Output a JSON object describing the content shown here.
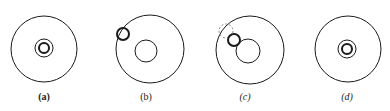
{
  "panels": [
    {
      "id": "a",
      "label": "(a)",
      "outer": {
        "cx": 44,
        "cy": 49,
        "r": 33
      },
      "inner_ring": {
        "cx": 44,
        "cy": 48,
        "r": 9
      },
      "inner_dot": {
        "cx": 44,
        "cy": 48,
        "r": 5
      },
      "label_x": 44
    },
    {
      "id": "b",
      "label": "(b)",
      "outer": {
        "cx": 150,
        "cy": 49,
        "r": 34
      },
      "big_circle": {
        "cx": 146,
        "cy": 51,
        "r": 11
      },
      "small_thick": {
        "cx": 123,
        "cy": 34,
        "r": 6
      },
      "label_x": 146
    },
    {
      "id": "c",
      "label": "(c)",
      "outer": {
        "cx": 250,
        "cy": 50,
        "r": 34
      },
      "big_circle": {
        "cx": 248,
        "cy": 50,
        "r": 12
      },
      "small_thick": {
        "cx": 234,
        "cy": 40,
        "r": 6
      },
      "dashed": {
        "cx": 226,
        "cy": 31,
        "r": 7
      },
      "label_x": 245
    },
    {
      "id": "d",
      "label": "(d)",
      "outer": {
        "cx": 348,
        "cy": 49,
        "r": 33
      },
      "inner_ring": {
        "cx": 347,
        "cy": 49,
        "r": 9
      },
      "inner_dot": {
        "cx": 347,
        "cy": 49,
        "r": 5
      },
      "label_x": 347
    }
  ],
  "colors": {
    "stroke": "#1a1a1a",
    "dashed": "#888888"
  }
}
